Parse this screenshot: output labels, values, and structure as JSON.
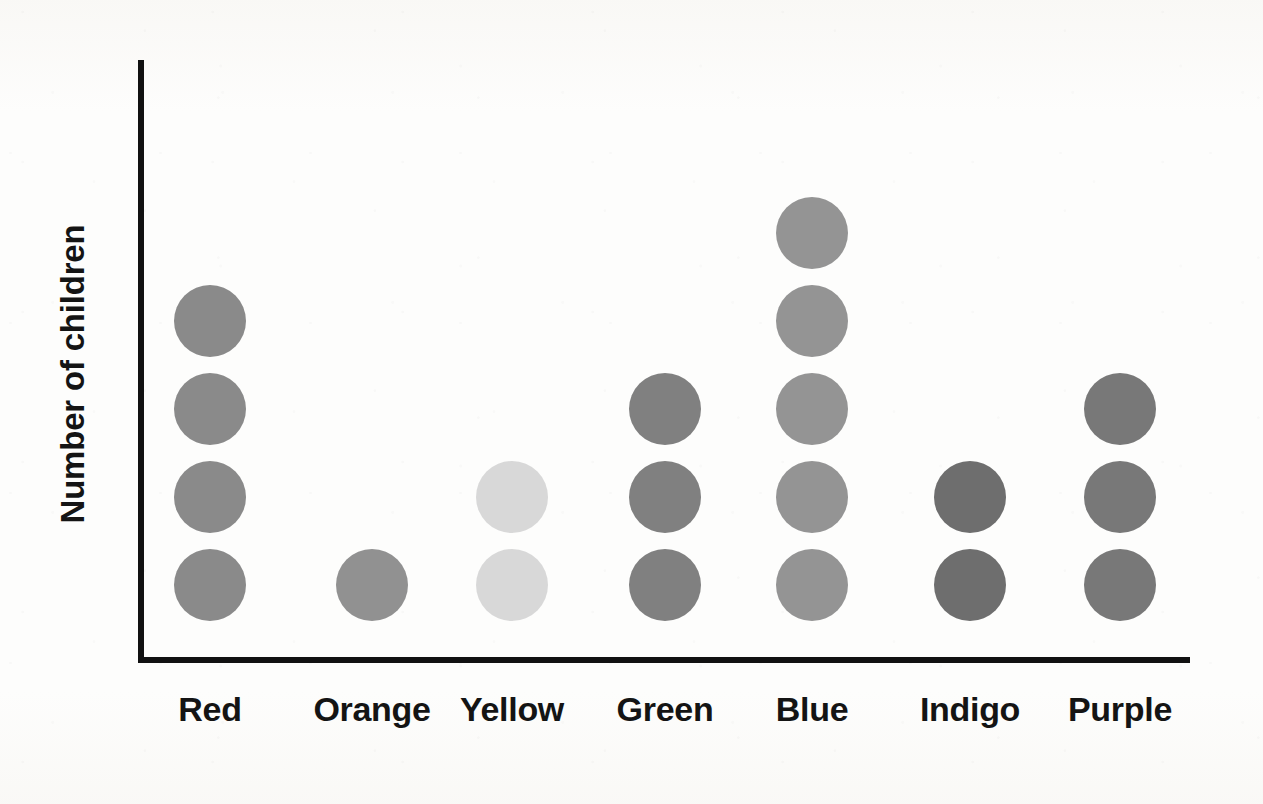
{
  "chart_data": {
    "type": "bar",
    "subtype": "dot-plot",
    "title": "",
    "xlabel": "",
    "ylabel": "Number of children",
    "categories": [
      "Red",
      "Orange",
      "Yellow",
      "Green",
      "Blue",
      "Indigo",
      "Purple"
    ],
    "values": [
      4,
      1,
      2,
      3,
      5,
      2,
      3
    ],
    "ylim": [
      0,
      6
    ],
    "grid": false,
    "legend": false,
    "unit_note": "each dot represents 1 child",
    "series": [
      {
        "name": "Number of children",
        "values": [
          4,
          1,
          2,
          3,
          5,
          2,
          3
        ]
      }
    ],
    "dot_colors": [
      "#8a8a8a",
      "#919191",
      "#d8d8d8",
      "#808080",
      "#949494",
      "#6e6e6e",
      "#787878"
    ]
  },
  "axis": {
    "y_title": "Number of children",
    "axis_color": "#111111"
  },
  "labels": {
    "red": "Red",
    "orange": "Orange",
    "yellow": "Yellow",
    "green": "Green",
    "blue": "Blue",
    "indigo": "Indigo",
    "purple": "Purple"
  },
  "geometry": {
    "dot_diameter": 72,
    "row_spacing": 88,
    "baseline_y": 585,
    "column_centers": [
      210,
      372,
      512,
      665,
      812,
      970,
      1120
    ]
  },
  "background": {
    "paper": "#fdfdfc"
  }
}
